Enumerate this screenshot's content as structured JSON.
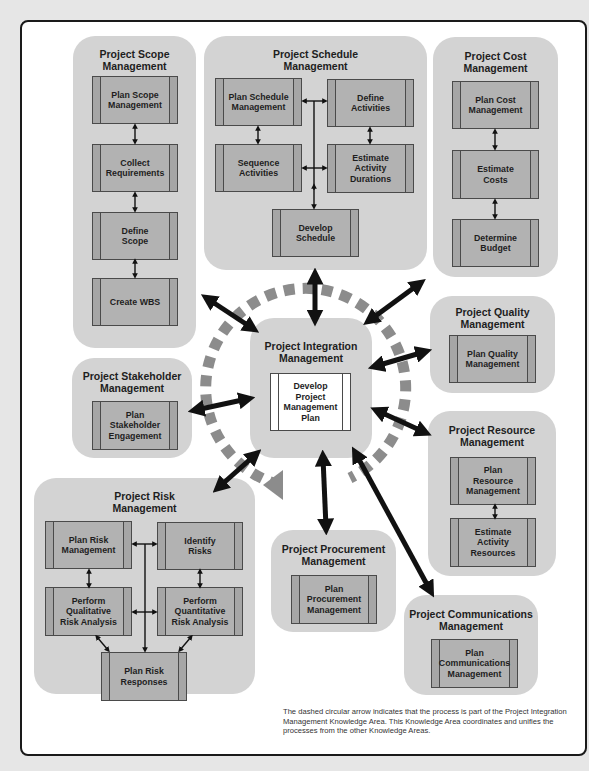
{
  "diagram": {
    "integration": {
      "title": "Project Integration\nManagement",
      "processes": [
        "Develop\nProject\nManagement\nPlan"
      ]
    },
    "areas": [
      {
        "id": "scope",
        "title": "Project Scope\nManagement",
        "processes": [
          "Plan Scope\nManagement",
          "Collect\nRequirements",
          "Define\nScope",
          "Create WBS"
        ]
      },
      {
        "id": "schedule",
        "title": "Project Schedule\nManagement",
        "processes": [
          "Plan Schedule\nManagement",
          "Define\nActivities",
          "Sequence\nActivities",
          "Estimate\nActivity\nDurations",
          "Develop\nSchedule"
        ]
      },
      {
        "id": "cost",
        "title": "Project Cost\nManagement",
        "processes": [
          "Plan Cost\nManagement",
          "Estimate\nCosts",
          "Determine\nBudget"
        ]
      },
      {
        "id": "quality",
        "title": "Project Quality\nManagement",
        "processes": [
          "Plan Quality\nManagement"
        ]
      },
      {
        "id": "stakeholder",
        "title": "Project Stakeholder\nManagement",
        "processes": [
          "Plan\nStakeholder\nEngagement"
        ]
      },
      {
        "id": "resource",
        "title": "Project Resource\nManagement",
        "processes": [
          "Plan\nResource\nManagement",
          "Estimate\nActivity\nResources"
        ]
      },
      {
        "id": "risk",
        "title": "Project Risk\nManagement",
        "processes": [
          "Plan Risk\nManagement",
          "Identify\nRisks",
          "Perform\nQualitative\nRisk Analysis",
          "Perform\nQuantitative\nRisk Analysis",
          "Plan Risk\nResponses"
        ]
      },
      {
        "id": "procurement",
        "title": "Project Procurement\nManagement",
        "processes": [
          "Plan\nProcurement\nManagement"
        ]
      },
      {
        "id": "communications",
        "title": "Project Communications\nManagement",
        "processes": [
          "Plan\nCommunications\nManagement"
        ]
      }
    ],
    "note": "The dashed circular arrow indicates that the process is part of the Project Integration Management Knowledge Area. This Knowledge Area coordinates and unifies the processes from the other Knowledge Areas.",
    "colors": {
      "area_bg": "#d3d3d3",
      "process_bg": "#b2b2b2",
      "process_border": "#4a4a4a",
      "arrow": "#111111",
      "dashed_circle": "#8c8c8c",
      "frame_border": "#1a1a1a",
      "page_bg": "#e6e6e6"
    }
  }
}
